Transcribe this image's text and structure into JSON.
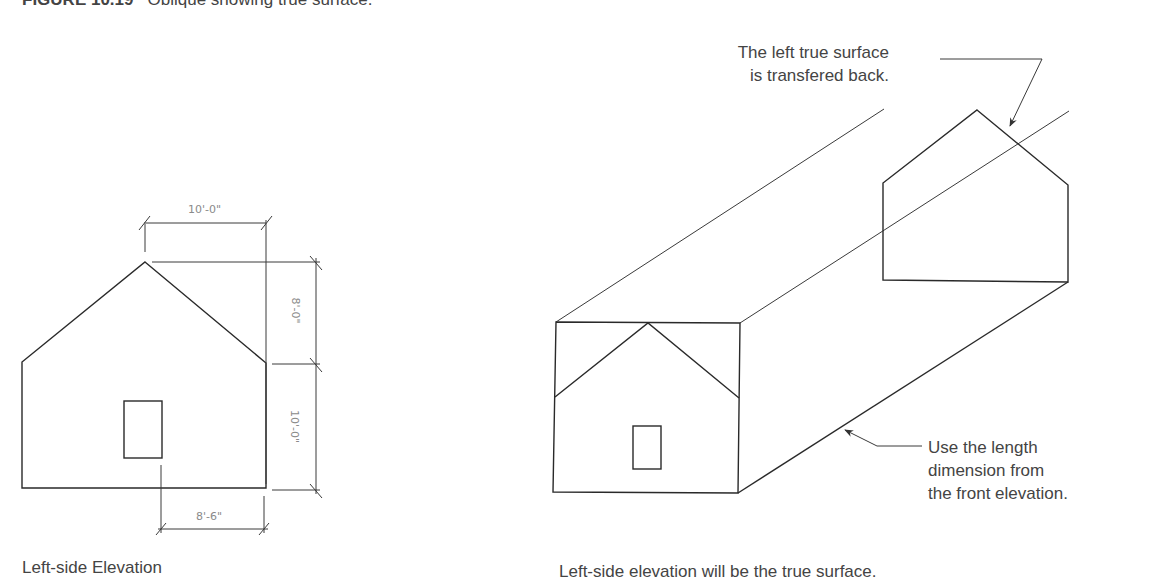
{
  "figure": {
    "number": "FIGURE 10.19",
    "caption": "Oblique showing true surface."
  },
  "left_drawing": {
    "label": "Left-side Elevation",
    "dimensions": {
      "top_width": "10'-0\"",
      "roof_height": "8'-0\"",
      "wall_height": "10'-0\"",
      "door_offset": "8'-6\""
    }
  },
  "right_drawing": {
    "label": "Left-side elevation will be the true surface.",
    "callout_top": {
      "line1": "The left true surface",
      "line2": "is transfered back."
    },
    "callout_bottom": {
      "line1": "Use the length",
      "line2": "dimension from",
      "line3": "the front elevation."
    }
  },
  "colors": {
    "line": "#2a2a2a",
    "text": "#444444",
    "dimension_text": "#8a8a8a",
    "background": "#ffffff"
  }
}
